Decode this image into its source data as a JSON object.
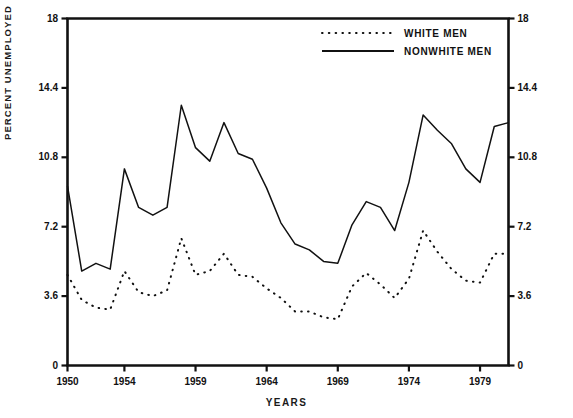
{
  "chart_data": {
    "type": "line",
    "title": "",
    "xlabel": "YEARS",
    "ylabel": "PERCENT UNEMPLOYED",
    "xlim": [
      1950,
      1981
    ],
    "ylim": [
      0,
      18
    ],
    "grid": false,
    "legend_position": "top-center",
    "x_ticks": [
      1950,
      1954,
      1959,
      1964,
      1969,
      1974,
      1979
    ],
    "x_tick_labels": [
      "1950",
      "1954",
      "1959",
      "1964",
      "1969",
      "1974",
      "1979"
    ],
    "y_ticks": [
      0,
      3.6,
      7.2,
      10.8,
      14.4,
      18
    ],
    "y_tick_labels": [
      "0",
      "3.6",
      "7.2",
      "10.8",
      "14.4",
      "18"
    ],
    "y_ticks_right": [
      0,
      3.6,
      7.2,
      10.8,
      14.4,
      18
    ],
    "y_tick_labels_right": [
      "0",
      "3.6",
      "7.2",
      "10.8",
      "14.4",
      "18"
    ],
    "x": [
      1950,
      1951,
      1952,
      1953,
      1954,
      1955,
      1956,
      1957,
      1958,
      1959,
      1960,
      1961,
      1962,
      1963,
      1964,
      1965,
      1966,
      1967,
      1968,
      1969,
      1970,
      1971,
      1972,
      1973,
      1974,
      1975,
      1976,
      1977,
      1978,
      1979,
      1980,
      1981
    ],
    "series": [
      {
        "name": "WHITE MEN",
        "style": "dotted",
        "color": "#111111",
        "values": [
          4.7,
          3.4,
          3.0,
          2.9,
          4.9,
          3.8,
          3.6,
          3.9,
          6.6,
          4.7,
          4.9,
          5.8,
          4.7,
          4.6,
          4.0,
          3.5,
          2.8,
          2.8,
          2.5,
          2.4,
          4.1,
          4.8,
          4.2,
          3.5,
          4.5,
          7.0,
          5.9,
          5.0,
          4.4,
          4.3,
          5.8,
          5.8
        ]
      },
      {
        "name": "NONWHITE MEN",
        "style": "solid",
        "color": "#111111",
        "values": [
          9.3,
          4.9,
          5.3,
          5.0,
          10.2,
          8.2,
          7.8,
          8.2,
          13.5,
          11.3,
          10.6,
          12.6,
          11.0,
          10.7,
          9.2,
          7.4,
          6.3,
          6.0,
          5.4,
          5.3,
          7.3,
          8.5,
          8.2,
          7.0,
          9.5,
          13.0,
          12.2,
          11.5,
          10.2,
          9.5,
          12.4,
          12.6
        ]
      }
    ]
  },
  "legend": {
    "entries": [
      {
        "label": "WHITE MEN",
        "style": "dotted"
      },
      {
        "label": "NONWHITE MEN",
        "style": "solid"
      }
    ]
  },
  "axes": {
    "y_title": "PERCENT UNEMPLOYED",
    "x_title": "YEARS"
  }
}
